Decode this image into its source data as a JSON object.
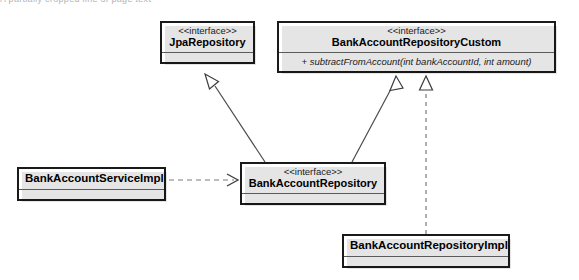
{
  "diagram": {
    "type": "uml-class-diagram",
    "background_color": "#ffffff",
    "line_color": "#4a4a4a",
    "border_color": "#1a1a1a",
    "top_cutoff_text": "A partially cropped line of page text",
    "classes": [
      {
        "id": "jpa-repository",
        "stereotype": "<<interface>>",
        "name": "JpaRepository",
        "operations": [],
        "has_empty_compartment": true
      },
      {
        "id": "bank-account-repository-custom",
        "stereotype": "<<interface>>",
        "name": "BankAccountRepositoryCustom",
        "operations": [
          "+ subtractFromAccount(int bankAccountId, int amount)"
        ],
        "has_empty_compartment": false
      },
      {
        "id": "bank-account-service-impl",
        "stereotype": "",
        "name": "BankAccountServiceImpl",
        "operations": [],
        "has_empty_compartment": true
      },
      {
        "id": "bank-account-repository",
        "stereotype": "<<interface>>",
        "name": "BankAccountRepository",
        "operations": [],
        "has_empty_compartment": true
      },
      {
        "id": "bank-account-repository-impl",
        "stereotype": "",
        "name": "BankAccountRepositoryImpl",
        "operations": [],
        "has_empty_compartment": true
      }
    ],
    "relationships": [
      {
        "id": "rel-repo-extends-jpa",
        "kind": "generalization",
        "line_style": "solid",
        "arrowhead": "hollow-triangle",
        "from": "bank-account-repository",
        "to": "jpa-repository"
      },
      {
        "id": "rel-repo-extends-custom",
        "kind": "generalization",
        "line_style": "solid",
        "arrowhead": "hollow-triangle",
        "from": "bank-account-repository",
        "to": "bank-account-repository-custom"
      },
      {
        "id": "rel-impl-realizes-custom",
        "kind": "realization",
        "line_style": "dashed",
        "arrowhead": "hollow-triangle",
        "from": "bank-account-repository-impl",
        "to": "bank-account-repository-custom"
      },
      {
        "id": "rel-service-depends-repo",
        "kind": "dependency",
        "line_style": "dashed",
        "arrowhead": "open-arrow",
        "from": "bank-account-service-impl",
        "to": "bank-account-repository"
      }
    ]
  }
}
